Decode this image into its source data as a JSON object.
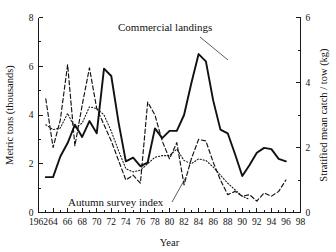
{
  "chart_data": {
    "type": "line",
    "title": "",
    "xlabel": "Year",
    "ylabel": "Metric tons (thousands)",
    "y2label": "Stratified mean catch / tow (kg)",
    "xlim": [
      1962,
      1998
    ],
    "ylim": [
      0,
      8
    ],
    "y2lim": [
      0,
      6
    ],
    "grid": false,
    "legend_position": "inline-annotations",
    "x_ticks": [
      "1962",
      "64",
      "66",
      "68",
      "70",
      "72",
      "74",
      "76",
      "78",
      "80",
      "82",
      "84",
      "86",
      "88",
      "90",
      "92",
      "94",
      "96",
      "98"
    ],
    "x_tick_values": [
      1962,
      1964,
      1966,
      1968,
      1970,
      1972,
      1974,
      1976,
      1978,
      1980,
      1982,
      1984,
      1986,
      1988,
      1990,
      1992,
      1994,
      1996,
      1998
    ],
    "x_minor_interval": 1,
    "y_ticks": [
      "0",
      "2",
      "4",
      "6",
      "8"
    ],
    "y_tick_values": [
      0,
      2,
      4,
      6,
      8
    ],
    "y_minor_interval": 1,
    "y2_ticks": [
      "0",
      "2",
      "4",
      "6"
    ],
    "y2_tick_values": [
      0,
      2,
      4,
      6
    ],
    "y2_minor_interval": 1,
    "annotations": [
      {
        "label": "Commercial landings",
        "x_px": 118,
        "y_px": 31,
        "leader_from": [
          200,
          37
        ],
        "leader_to": [
          228,
          60
        ]
      },
      {
        "label": "Autumn survey index",
        "x_px": 68,
        "y_px": 206,
        "leader_from": [
          172,
          202
        ],
        "leader_to": [
          186,
          177
        ]
      }
    ],
    "series": [
      {
        "name": "Commercial landings",
        "style": "solid",
        "axis": "left",
        "unit": "metric tons (thousands)",
        "x": [
          1963,
          1964,
          1965,
          1966,
          1967,
          1968,
          1969,
          1970,
          1971,
          1972,
          1973,
          1974,
          1975,
          1976,
          1977,
          1978,
          1979,
          1980,
          1981,
          1982,
          1983,
          1984,
          1985,
          1986,
          1987,
          1988,
          1989,
          1990,
          1991,
          1992,
          1993,
          1994,
          1995,
          1996
        ],
        "values": [
          1.45,
          1.45,
          2.3,
          2.85,
          3.6,
          3.1,
          3.75,
          3.25,
          5.9,
          5.6,
          3.7,
          2.1,
          2.25,
          1.9,
          2.05,
          3.45,
          3.05,
          3.35,
          3.35,
          4.0,
          5.3,
          6.5,
          6.2,
          4.6,
          3.4,
          3.25,
          2.4,
          1.5,
          1.95,
          2.45,
          2.65,
          2.6,
          2.2,
          2.1
        ]
      },
      {
        "name": "Autumn survey index",
        "style": "dashed",
        "axis": "right",
        "unit": "kg / tow",
        "x": [
          1963,
          1964,
          1965,
          1966,
          1967,
          1968,
          1969,
          1970,
          1971,
          1972,
          1973,
          1974,
          1975,
          1976,
          1977,
          1978,
          1979,
          1980,
          1981,
          1982,
          1983,
          1984,
          1985,
          1986,
          1987,
          1988,
          1989,
          1990,
          1991,
          1992,
          1993,
          1994,
          1995,
          1996
        ],
        "values": [
          3.5,
          2.0,
          2.85,
          4.55,
          2.05,
          3.3,
          4.45,
          3.2,
          2.7,
          2.2,
          1.6,
          1.0,
          1.15,
          0.9,
          3.4,
          3.0,
          2.2,
          1.65,
          2.15,
          0.85,
          1.65,
          2.25,
          2.2,
          1.55,
          1.0,
          0.55,
          0.65,
          0.5,
          0.55,
          0.35,
          0.6,
          0.5,
          0.65,
          1.0
        ]
      },
      {
        "name": "Autumn survey index (smoothed)",
        "style": "dotted",
        "axis": "right",
        "unit": "kg / tow",
        "x": [
          1963,
          1964,
          1965,
          1966,
          1967,
          1968,
          1969,
          1970,
          1971,
          1972,
          1973,
          1974,
          1975,
          1976,
          1977,
          1978,
          1979,
          1980,
          1981,
          1982,
          1983,
          1984,
          1985,
          1986,
          1987,
          1988,
          1989,
          1990,
          1991
        ],
        "values": [
          2.7,
          2.55,
          2.6,
          3.05,
          2.6,
          2.75,
          3.25,
          3.2,
          3.0,
          2.5,
          1.9,
          1.35,
          1.25,
          1.3,
          1.5,
          1.7,
          1.75,
          1.75,
          1.95,
          1.6,
          1.5,
          1.65,
          1.6,
          1.4,
          1.15,
          0.9,
          0.7,
          0.5,
          0.4
        ]
      }
    ]
  }
}
